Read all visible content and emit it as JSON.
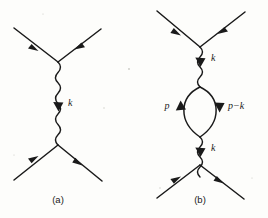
{
  "figure": {
    "background_color": "#fdfdfb",
    "ink_color": "#1a1a1a",
    "width": 268,
    "height": 218,
    "panels": [
      {
        "id": "a",
        "caption": "(a)",
        "caption_x": 58,
        "caption_y": 203,
        "description": "tree-level single photon exchange",
        "momentum_labels": [
          {
            "text": "k",
            "x": 68,
            "y": 106
          }
        ]
      },
      {
        "id": "b",
        "caption": "(b)",
        "caption_x": 200,
        "caption_y": 203,
        "description": "one-loop vacuum polarization correction",
        "momentum_labels": [
          {
            "text": "k",
            "x": 211,
            "y": 61
          },
          {
            "text": "p",
            "x": 167,
            "y": 106
          },
          {
            "text": "p−k",
            "x": 228,
            "y": 106
          },
          {
            "text": "k",
            "x": 211,
            "y": 151
          }
        ]
      }
    ]
  }
}
